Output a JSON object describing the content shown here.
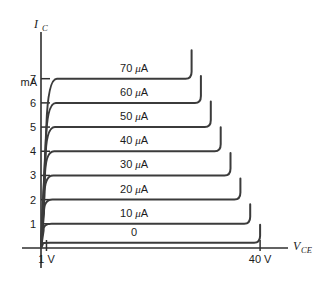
{
  "chart_data": {
    "type": "line",
    "title": "",
    "subtitle": "",
    "xlabel": "V_CE",
    "ylabel": "I_C",
    "x_axis_symbol": "V",
    "x_axis_subscript": "CE",
    "y_axis_symbol": "I",
    "y_axis_subscript": "C",
    "y_unit": "mA",
    "x_unit": "V",
    "xlim": [
      0,
      44
    ],
    "ylim": [
      0,
      8.6
    ],
    "grid": false,
    "legend_position": "inline-on-curves",
    "x_tick_labels": [
      "1 V",
      "40 V"
    ],
    "x_tick_values": [
      1,
      40
    ],
    "y_tick_labels": [
      "1",
      "2",
      "3",
      "4",
      "5",
      "6",
      "7"
    ],
    "y_tick_values": [
      1,
      2,
      3,
      4,
      5,
      6,
      7
    ],
    "series": [
      {
        "name": "0",
        "label": "0",
        "base_current_ua": 0,
        "plateau_current_ma": 0.22,
        "knee_voltage": 0.6,
        "breakdown_voltage": 40.0
      },
      {
        "name": "10 μA",
        "label": "10 μA",
        "base_current_ua": 10,
        "plateau_current_ma": 1.0,
        "knee_voltage": 0.85,
        "breakdown_voltage": 38.2
      },
      {
        "name": "20 μA",
        "label": "20 μA",
        "base_current_ua": 20,
        "plateau_current_ma": 2.0,
        "knee_voltage": 1.0,
        "breakdown_voltage": 36.4
      },
      {
        "name": "30 μA",
        "label": "30 μA",
        "base_current_ua": 30,
        "plateau_current_ma": 3.0,
        "knee_voltage": 1.15,
        "breakdown_voltage": 34.6
      },
      {
        "name": "40 μA",
        "label": "40 μA",
        "base_current_ua": 40,
        "plateau_current_ma": 4.0,
        "knee_voltage": 1.3,
        "breakdown_voltage": 32.8
      },
      {
        "name": "50 μA",
        "label": "50 μA",
        "base_current_ua": 50,
        "plateau_current_ma": 5.0,
        "knee_voltage": 1.45,
        "breakdown_voltage": 31.0
      },
      {
        "name": "60 μA",
        "label": "60 μA",
        "base_current_ua": 60,
        "plateau_current_ma": 6.0,
        "knee_voltage": 1.6,
        "breakdown_voltage": 29.2
      },
      {
        "name": "70 μA",
        "label": "70 μA",
        "base_current_ua": 70,
        "plateau_current_ma": 7.0,
        "knee_voltage": 1.8,
        "breakdown_voltage": 27.5
      }
    ],
    "curve_label_voltage": 17,
    "colors": {
      "curve": "#3b3b3b",
      "axis": "#2f2f2f",
      "text": "#1c1c1c",
      "background": "#ffffff"
    }
  }
}
